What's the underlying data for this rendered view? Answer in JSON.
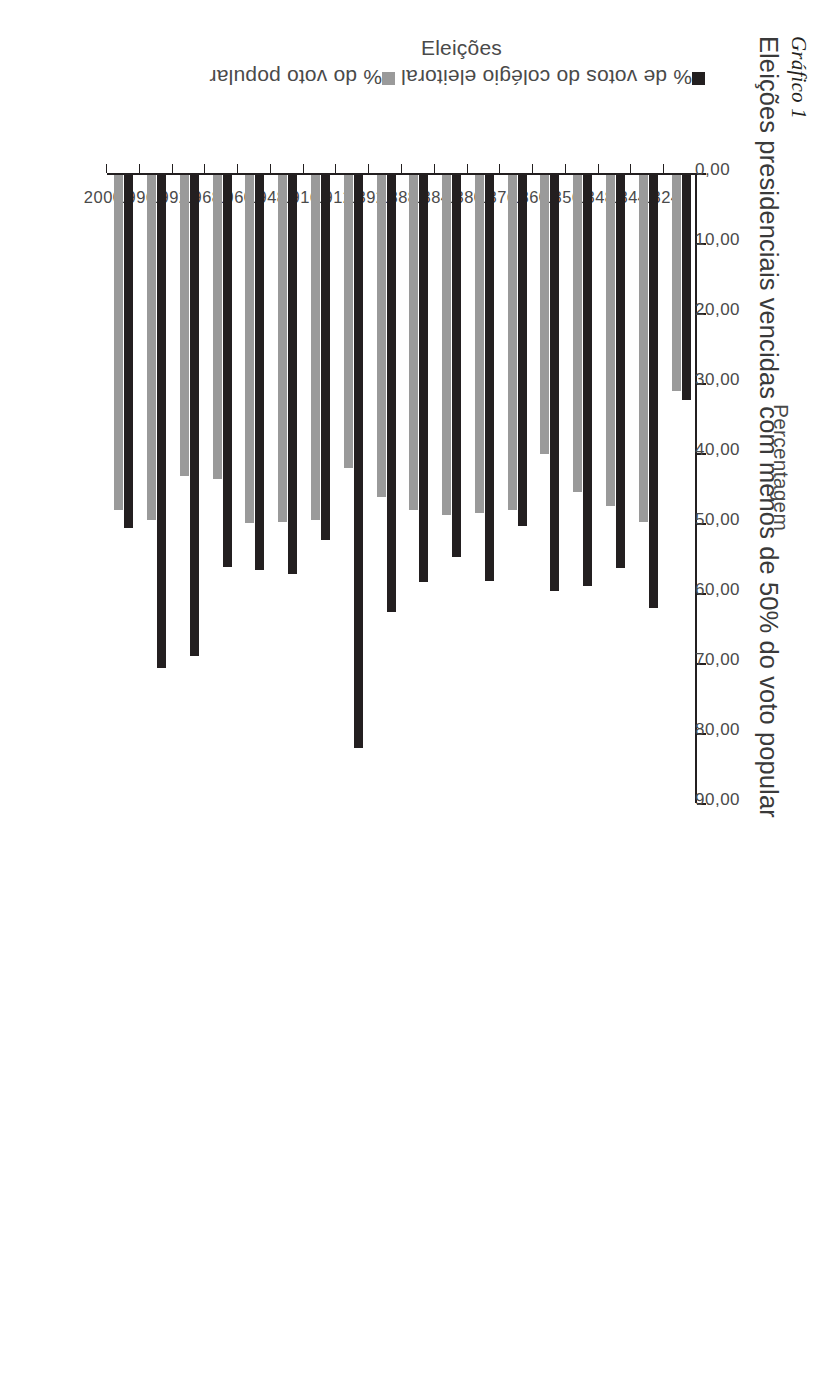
{
  "figure": {
    "label": "Gráfico 1",
    "title": "Eleições presidenciais vencidas com menos de 50% do voto popular"
  },
  "legend": {
    "items": [
      {
        "label": "% de votos do colégio eleitoral",
        "color": "#231f20"
      },
      {
        "label": "% do voto popular",
        "color": "#9a9a9a"
      }
    ]
  },
  "axes": {
    "value_title": "Percentagem",
    "category_title": "Eleições",
    "value_ticks": [
      "0,00",
      "10,00",
      "20,00",
      "30,00",
      "40,00",
      "50,00",
      "60,00",
      "70,00",
      "80,00",
      "90,00"
    ]
  },
  "chart_data": {
    "type": "bar",
    "title": "Eleições presidenciais vencidas com menos de 50% do voto popular",
    "xlabel": "Eleições",
    "ylabel": "Percentagem",
    "orientation": "horizontal",
    "grid": false,
    "legend_position": "left",
    "ylim": [
      0,
      90
    ],
    "tick_step": 10,
    "categories": [
      "1824",
      "1844",
      "1848",
      "1856",
      "1860",
      "1876",
      "1880",
      "1884",
      "1888",
      "1892",
      "1912",
      "1916",
      "1948",
      "1960",
      "1968",
      "1992",
      "1996",
      "2000"
    ],
    "series": [
      {
        "name": "% de votos do colégio eleitoral",
        "color": "#231f20",
        "values": [
          32.18,
          61.8,
          56.21,
          58.78,
          59.41,
          50.14,
          57.99,
          54.61,
          58.1,
          62.39,
          81.92,
          52.17,
          57.06,
          56.42,
          55.95,
          68.77,
          70.45,
          50.37
        ]
      },
      {
        "name": "% do voto popular",
        "color": "#9a9a9a",
        "values": [
          30.92,
          49.54,
          47.28,
          45.31,
          39.82,
          47.92,
          48.27,
          48.5,
          47.8,
          46.02,
          41.84,
          49.24,
          49.55,
          49.72,
          43.42,
          43.01,
          49.23,
          47.87
        ]
      }
    ]
  }
}
